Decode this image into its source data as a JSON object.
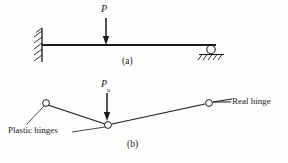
{
  "figure": {
    "background_color": "#fdfdfb",
    "line_color": "#1b1b1b",
    "width": 288,
    "height": 163
  },
  "panel_a": {
    "caption": "(a)",
    "load_label": "P",
    "beam": {
      "x1": 42,
      "y1": 45,
      "x2": 216,
      "y2": 45
    },
    "supports": [
      {
        "name": "fixed-support",
        "x": 42,
        "y": 45
      },
      {
        "name": "roller-support",
        "x": 211,
        "y": 47
      }
    ],
    "load_arrow": {
      "x": 106,
      "y_top": 18,
      "y_bottom": 44
    }
  },
  "panel_b": {
    "caption": "(b)",
    "load_label_base": "P",
    "load_label_sub": "u",
    "load_arrow": {
      "x": 107,
      "y_top": 93,
      "y_bottom": 120
    },
    "hinges": [
      {
        "name": "plastic-hinge-left",
        "x": 46,
        "y": 103,
        "type": "plastic"
      },
      {
        "name": "plastic-hinge-center",
        "x": 108,
        "y": 125,
        "type": "plastic"
      },
      {
        "name": "real-hinge-right",
        "x": 209,
        "y": 103,
        "type": "real"
      }
    ],
    "annotations": {
      "real_hinge": "Real hinge",
      "plastic_hinges": "Plastic hinges"
    }
  }
}
